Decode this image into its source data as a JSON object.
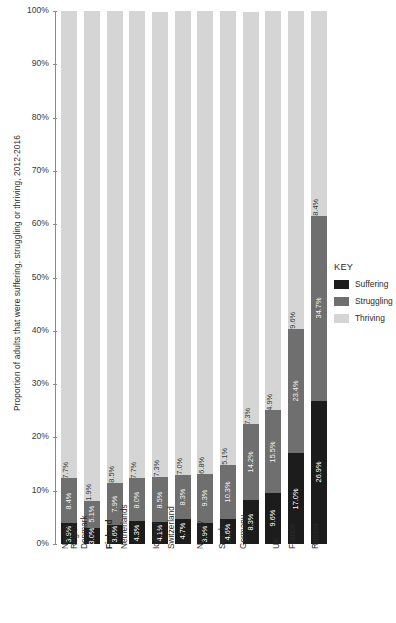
{
  "chart_data": {
    "type": "bar",
    "stacked": true,
    "stack_mode": "percent",
    "title": "",
    "xlabel": "",
    "ylabel": "Proportion of adults that were suffering, struggling or thriving, 2012-2016",
    "ylim": [
      0,
      100
    ],
    "ytick_labels": [
      "100%",
      "90%",
      "80%",
      "70%",
      "60%",
      "50%",
      "40%",
      "30%",
      "20%",
      "10%",
      "0%"
    ],
    "ytick_values": [
      100,
      90,
      80,
      70,
      60,
      50,
      40,
      30,
      20,
      10,
      0
    ],
    "grid": false,
    "legend_position": "right",
    "legend_title": "KEY",
    "categories": [
      "Nordic Region",
      "Denmark",
      "Finland",
      "Netherlands",
      "Iceland",
      "Switzerland",
      "Norway",
      "Sweden",
      "Germany",
      "UK",
      "France",
      "Russia"
    ],
    "category_lines": [
      [
        "Nordic",
        "Region"
      ],
      [
        "Denmark"
      ],
      [
        "Finland"
      ],
      [
        "Netherlands"
      ],
      [
        "Iceland"
      ],
      [
        "Switzerland"
      ],
      [
        "Norway"
      ],
      [
        "Sweden"
      ],
      [
        "Germany"
      ],
      [
        "UK"
      ],
      [
        "France"
      ],
      [
        "Russia"
      ]
    ],
    "highlighted_category": "Finland",
    "series": [
      {
        "name": "Suffering",
        "color": "#1c1c1c",
        "values": [
          3.9,
          3.0,
          3.6,
          4.3,
          4.1,
          4.7,
          3.9,
          4.6,
          8.3,
          9.6,
          17.0,
          26.9
        ],
        "labels": [
          "3.9%",
          "3.0%",
          "3.6%",
          "4.3%",
          "4.1%",
          "4.7%",
          "3.9%",
          "4.6%",
          "8.3%",
          "9.6%",
          "17.0%",
          "26.9%"
        ]
      },
      {
        "name": "Struggling",
        "color": "#6f6f6f",
        "values": [
          8.4,
          5.1,
          7.9,
          8.0,
          8.5,
          8.3,
          9.3,
          10.3,
          14.2,
          15.5,
          23.4,
          34.7
        ],
        "labels": [
          "8.4%",
          "5.1%",
          "7.9%",
          "8.0%",
          "8.5%",
          "8.3%",
          "9.3%",
          "10.3%",
          "14.2%",
          "15.5%",
          "23.4%",
          "34.7%"
        ]
      },
      {
        "name": "Thriving",
        "color": "#d5d5d5",
        "values": [
          87.7,
          91.9,
          88.5,
          87.7,
          87.3,
          87.0,
          86.8,
          85.1,
          77.3,
          74.9,
          59.6,
          38.4
        ],
        "labels": [
          "87.7%",
          "91.9%",
          "88.5%",
          "87.7%",
          "87.3%",
          "87.0%",
          "86.8%",
          "85.1%",
          "77.3%",
          "74.9%",
          "59.6%",
          "38.4%"
        ]
      }
    ]
  },
  "axis": {
    "title": "Proportion of adults that were suffering, struggling or thriving, 2012-2016"
  },
  "legend": {
    "title": "KEY",
    "entries": [
      {
        "label": "Suffering",
        "color": "#1c1c1c"
      },
      {
        "label": "Struggling",
        "color": "#6f6f6f"
      },
      {
        "label": "Thriving",
        "color": "#d5d5d5"
      }
    ]
  }
}
